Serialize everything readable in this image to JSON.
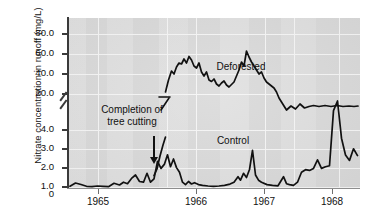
{
  "chart_data": {
    "type": "line",
    "title": "",
    "xlabel": "",
    "ylabel": "Nitrate concentration in runoff (mg/L)",
    "y_axis": {
      "broken": true,
      "tick_labels": [
        "0",
        "1.0",
        "2.0",
        "3.0",
        "4.0",
        "20.0",
        "40.0",
        "60.0",
        "80.0"
      ],
      "lower_segment_range": [
        0,
        4.0
      ],
      "upper_segment_range": [
        20.0,
        80.0
      ],
      "break_between": [
        4.0,
        20.0
      ]
    },
    "x_axis": {
      "tick_labels": [
        "1965",
        "1966",
        "1967",
        "1968"
      ],
      "range": [
        "1964.4",
        "1968.6"
      ]
    },
    "grid": true,
    "legend_position": "inline-annotations",
    "annotations": [
      {
        "text": "Deforested",
        "series": "Deforested"
      },
      {
        "text": "Control",
        "series": "Control"
      },
      {
        "text": "Completion of tree cutting",
        "kind": "arrow-callout",
        "points_to": "1965.55"
      }
    ],
    "series": [
      {
        "name": "Control",
        "color": "#111111",
        "x": [
          1964.42,
          1964.5,
          1964.58,
          1964.66,
          1964.74,
          1964.82,
          1964.9,
          1964.98,
          1965.06,
          1965.14,
          1965.2,
          1965.26,
          1965.32,
          1965.38,
          1965.44,
          1965.5,
          1965.55,
          1965.6,
          1965.65,
          1965.7,
          1965.75,
          1965.8,
          1965.84,
          1965.88,
          1965.92,
          1965.96,
          1966.0,
          1966.04,
          1966.08,
          1966.12,
          1966.16,
          1966.2,
          1966.26,
          1966.32,
          1966.4,
          1966.48,
          1966.56,
          1966.64,
          1966.72,
          1966.78,
          1966.84,
          1966.88,
          1966.92,
          1966.96,
          1967.0,
          1967.04,
          1967.08,
          1967.12,
          1967.16,
          1967.24,
          1967.32,
          1967.4,
          1967.48,
          1967.52,
          1967.56,
          1967.62,
          1967.68,
          1967.74,
          1967.8,
          1967.86,
          1967.92,
          1967.98,
          1968.04,
          1968.1,
          1968.16,
          1968.22,
          1968.28,
          1968.34,
          1968.4,
          1968.46,
          1968.52,
          1968.58
        ],
        "y": [
          0.12,
          0.3,
          0.22,
          0.12,
          0.1,
          0.14,
          0.12,
          0.1,
          0.28,
          0.18,
          0.32,
          0.24,
          0.52,
          0.7,
          0.34,
          0.3,
          0.78,
          0.3,
          0.48,
          1.4,
          0.82,
          1.05,
          1.55,
          0.9,
          1.3,
          0.8,
          0.55,
          0.3,
          0.18,
          0.32,
          0.2,
          0.28,
          0.18,
          0.14,
          0.12,
          0.1,
          0.12,
          0.16,
          0.22,
          0.3,
          0.6,
          0.42,
          0.8,
          0.55,
          1.0,
          2.0,
          0.7,
          0.4,
          0.28,
          0.2,
          0.18,
          0.16,
          0.55,
          0.22,
          0.18,
          0.16,
          0.3,
          0.8,
          0.95,
          0.9,
          1.0,
          1.45,
          0.95,
          1.0,
          1.05,
          2.9,
          3.35,
          1.4,
          0.7,
          0.62,
          0.95,
          0.8
        ]
      },
      {
        "name": "Deforested",
        "color": "#111111",
        "x": [
          1965.84,
          1965.88,
          1965.92,
          1965.96,
          1966.0,
          1966.04,
          1966.08,
          1966.12,
          1966.16,
          1966.2,
          1966.24,
          1966.28,
          1966.32,
          1966.36,
          1966.4,
          1966.44,
          1966.48,
          1966.52,
          1966.56,
          1966.6,
          1966.64,
          1966.68,
          1966.72,
          1966.76,
          1966.8,
          1966.84,
          1966.88,
          1966.92,
          1966.96,
          1967.0,
          1967.04,
          1967.08,
          1967.12,
          1967.16,
          1967.2,
          1967.24,
          1967.28,
          1967.32,
          1967.36,
          1967.4,
          1967.44,
          1967.48,
          1967.52,
          1967.56,
          1967.6,
          1967.64,
          1967.68,
          1967.72,
          1967.76,
          1967.8,
          1967.84,
          1967.88,
          1967.92,
          1967.96,
          1968.0,
          1968.04,
          1968.08,
          1968.12,
          1968.16,
          1968.22,
          1968.28,
          1968.34,
          1968.4,
          1968.46,
          1968.52,
          1968.58
        ],
        "y": [
          3.4,
          8.0,
          14.0,
          20.0,
          28.0,
          38.0,
          48.0,
          58.0,
          61.0,
          58.0,
          62.0,
          64.0,
          63.5,
          66.0,
          64.0,
          68.0,
          66.0,
          69.0,
          67.5,
          65.0,
          64.0,
          66.5,
          62.0,
          60.0,
          62.0,
          58.0,
          57.5,
          58.5,
          56.0,
          55.0,
          54.0,
          55.0,
          57.0,
          58.0,
          57.0,
          60.0,
          63.0,
          66.0,
          70.0,
          68.0,
          75.0,
          72.0,
          70.0,
          68.0,
          66.0,
          64.0,
          62.0,
          63.0,
          60.0,
          58.0,
          57.0,
          56.0,
          54.0,
          52.0,
          48.0,
          45.0,
          43.0,
          40.0,
          38.0,
          40.0,
          38.5,
          41.0,
          39.0,
          41.0,
          39.5,
          40.0
        ]
      }
    ]
  }
}
